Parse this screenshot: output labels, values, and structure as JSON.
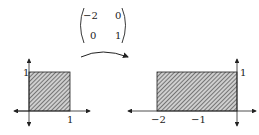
{
  "matrix": {
    "r0c0": "−2",
    "r0c1": "0",
    "r1c0": "0",
    "r1c1": "1"
  },
  "left_plot": {
    "y_tick_label": "1",
    "x_tick_label": "1"
  },
  "right_plot": {
    "y_tick_label": "1",
    "x_tick_labels": [
      "−2",
      "−1"
    ]
  },
  "colors": {
    "ink": "#222222",
    "hatch_fill": "#9a9a9a"
  }
}
